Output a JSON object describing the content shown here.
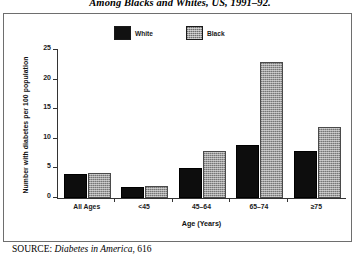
{
  "figure": {
    "caption": "Among Blacks and Whites, US, 1991–92.",
    "source_label": "SOURCE:",
    "source_title": "Diabetes in America",
    "source_page": ", 616"
  },
  "chart_data": {
    "type": "bar",
    "title": "Among Blacks and Whites, US, 1991–92.",
    "xlabel": "Age (Years)",
    "ylabel": "Number with diabetes per 100 population",
    "categories": [
      "All Ages",
      "<45",
      "45–64",
      "65–74",
      "≥75"
    ],
    "series": [
      {
        "name": "White",
        "color": "#0d0d0d",
        "values": [
          4.0,
          1.8,
          5.1,
          9.0,
          8.0
        ]
      },
      {
        "name": "Black",
        "color": "#9d9d9d",
        "values": [
          4.3,
          2.1,
          8.0,
          23.0,
          12.0
        ]
      }
    ],
    "ylim": [
      0,
      25
    ],
    "yticks": [
      0,
      5,
      10,
      15,
      20,
      25
    ],
    "ytick_labels": [
      "0",
      "5",
      "10",
      "15",
      "20",
      "25"
    ],
    "grid": false,
    "legend_position": "top-center"
  }
}
